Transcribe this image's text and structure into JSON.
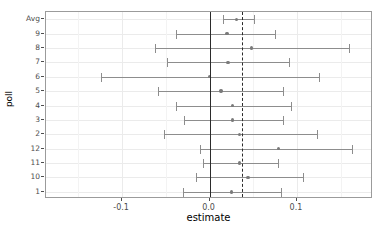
{
  "chart_data": {
    "type": "scatter",
    "subtype": "forest-plot",
    "title": "",
    "xlabel": "estimate",
    "ylabel": "poll",
    "xlim": [
      -0.187,
      0.187
    ],
    "xticks": [
      -0.1,
      0.0,
      0.1
    ],
    "xtick_labels": [
      "-0.1",
      "0.0",
      "0.1"
    ],
    "xticks_minor": [
      -0.15,
      -0.05,
      0.05,
      0.15
    ],
    "grid": true,
    "legend": null,
    "reference_lines": [
      {
        "name": "zero-line",
        "x": 0.0,
        "style": "solid",
        "color": "#2b2b2b"
      },
      {
        "name": "mean-line",
        "x": 0.037,
        "style": "dashed",
        "color": "#2b2b2b"
      }
    ],
    "categories": [
      "Avg",
      "9",
      "8",
      "7",
      "6",
      "5",
      "4",
      "3",
      "2",
      "12",
      "11",
      "10",
      "1"
    ],
    "point_color": "#7a7a7a",
    "error_color": "#8d8d8d",
    "points": [
      {
        "label": "Avg",
        "estimate": 0.031,
        "low": 0.015,
        "high": 0.051
      },
      {
        "label": "9",
        "estimate": 0.02,
        "low": -0.038,
        "high": 0.075
      },
      {
        "label": "8",
        "estimate": 0.048,
        "low": -0.062,
        "high": 0.16
      },
      {
        "label": "7",
        "estimate": 0.021,
        "low": -0.049,
        "high": 0.091
      },
      {
        "label": "6",
        "estimate": 0.0,
        "low": -0.124,
        "high": 0.125
      },
      {
        "label": "5",
        "estimate": 0.013,
        "low": -0.059,
        "high": 0.084
      },
      {
        "label": "4",
        "estimate": 0.026,
        "low": -0.038,
        "high": 0.093
      },
      {
        "label": "3",
        "estimate": 0.026,
        "low": -0.029,
        "high": 0.084
      },
      {
        "label": "2",
        "estimate": 0.034,
        "low": -0.052,
        "high": 0.123
      },
      {
        "label": "12",
        "estimate": 0.079,
        "low": -0.011,
        "high": 0.163
      },
      {
        "label": "11",
        "estimate": 0.034,
        "low": -0.007,
        "high": 0.078
      },
      {
        "label": "10",
        "estimate": 0.044,
        "low": -0.015,
        "high": 0.107
      },
      {
        "label": "1",
        "estimate": 0.025,
        "low": -0.03,
        "high": 0.082
      }
    ]
  }
}
